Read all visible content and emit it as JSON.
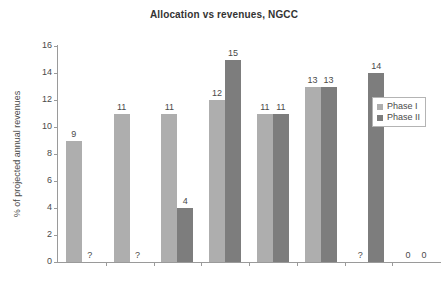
{
  "chart_data": {
    "type": "bar",
    "title": "Allocation vs revenues, NGCC",
    "xlabel": "",
    "ylabel": "% of projected annual revenues",
    "ylim": [
      0,
      16
    ],
    "yticks": [
      "0",
      "2",
      "4",
      "6",
      "8",
      "10",
      "12",
      "14",
      "16"
    ],
    "grid": false,
    "legend_position": "top-right-inside",
    "categories": [
      "Denmark",
      "Estonia",
      "Finland",
      "Germany",
      "Latvia",
      "Lithuania",
      "Poland",
      "Sweden"
    ],
    "series": [
      {
        "name": "Phase I",
        "color": "#aeaeae",
        "values": [
          9,
          11,
          11,
          12,
          11,
          13,
          null,
          0
        ],
        "labels": [
          "9",
          "11",
          "11",
          "12",
          "11",
          "13",
          "?",
          "0"
        ]
      },
      {
        "name": "Phase II",
        "color": "#7d7d7d",
        "values": [
          null,
          null,
          4,
          15,
          11,
          13,
          14,
          0
        ],
        "labels": [
          "?",
          "?",
          "4",
          "15",
          "11",
          "13",
          "14",
          "0"
        ]
      }
    ]
  },
  "legend": {
    "items": [
      {
        "label": "Phase I"
      },
      {
        "label": "Phase II"
      }
    ]
  }
}
